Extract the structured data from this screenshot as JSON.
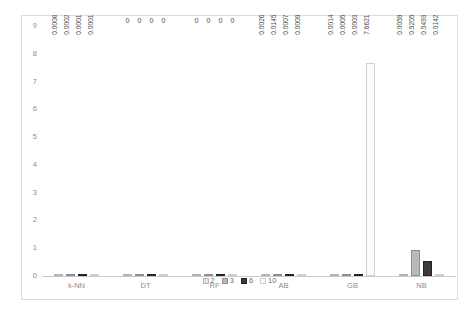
{
  "chart_data": {
    "type": "bar",
    "title": "",
    "subtitle": "",
    "xlabel": "",
    "ylabel": "",
    "ylim": [
      0,
      9
    ],
    "yticks": [
      0,
      1,
      2,
      3,
      4,
      5,
      6,
      7,
      8,
      9
    ],
    "ytick_labels": [
      "0",
      "1",
      "2",
      "3",
      "4",
      "5",
      "6",
      "7",
      "8",
      "9"
    ],
    "grid": false,
    "legend_position": "bottom",
    "categories": [
      "k-NN",
      "DT",
      "RF",
      "AB",
      "GB",
      "NB"
    ],
    "series": [
      {
        "name": "2",
        "color": "#e3e3e3",
        "values": [
          0.0008,
          0,
          0,
          0.0026,
          0.0014,
          0.0059
        ],
        "labels": [
          "0.0008",
          "0",
          "0",
          "0.0026",
          "0.0014",
          "0.0059"
        ]
      },
      {
        "name": "3",
        "color": "#b9b9b9",
        "values": [
          0.0002,
          0,
          0,
          0.0145,
          0.0005,
          0.9205
        ],
        "labels": [
          "0.0002",
          "0",
          "0",
          "0.0145",
          "0.0005",
          "0.9205"
        ]
      },
      {
        "name": "6",
        "color": "#3a3a3a",
        "values": [
          0.0001,
          0,
          0,
          0.0007,
          0.0003,
          0.5493
        ],
        "labels": [
          "0.0001",
          "0",
          "0",
          "0.0007",
          "0.0003",
          "0.5493"
        ]
      },
      {
        "name": "10",
        "color": "#fbfbfb",
        "values": [
          0.0001,
          0,
          0,
          0.0009,
          7.6621,
          0.0142
        ],
        "labels": [
          "0.0001",
          "0",
          "0",
          "0.0009",
          "7.6621",
          "0.0142"
        ]
      }
    ]
  },
  "legend": {
    "items": [
      {
        "label": "2"
      },
      {
        "label": "3"
      },
      {
        "label": "6"
      },
      {
        "label": "10"
      }
    ]
  }
}
